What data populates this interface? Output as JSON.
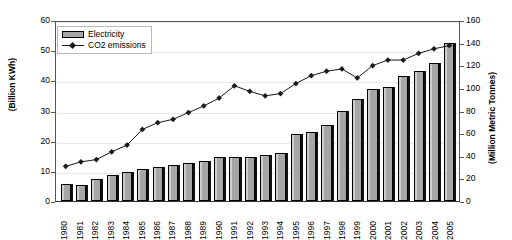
{
  "chart_data": {
    "type": "bar",
    "title": "",
    "xlabel": "",
    "ylabel": "(Billion KWh)",
    "y2label": "(Million Metric Tonnes)",
    "grid": true,
    "legend_position": "top-left",
    "ylim": [
      0,
      60
    ],
    "y2lim": [
      0,
      160
    ],
    "yticks": [
      0,
      10,
      20,
      30,
      40,
      50,
      60
    ],
    "y2ticks": [
      0,
      20,
      40,
      60,
      80,
      100,
      120,
      140,
      160
    ],
    "categories": [
      "1980",
      "1981",
      "1982",
      "1983",
      "1984",
      "1985",
      "1986",
      "1987",
      "1988",
      "1989",
      "1990",
      "1991",
      "1992",
      "1993",
      "1994",
      "1995",
      "1996",
      "1997",
      "1998",
      "1999",
      "2000",
      "2001",
      "2002",
      "2003",
      "2004",
      "2005"
    ],
    "series": [
      {
        "name": "Electricity",
        "axis": "left",
        "render": "bar",
        "color": "#a6a6a6",
        "units": "Billion KWh",
        "values": [
          5.6,
          5.3,
          7.4,
          8.6,
          9.5,
          10.5,
          11.2,
          11.8,
          12.7,
          13.1,
          14.5,
          14.5,
          14.6,
          15.3,
          16.0,
          22.2,
          23.0,
          25.1,
          30.0,
          33.8,
          37.0,
          37.7,
          41.5,
          43.2,
          45.8,
          52.5
        ]
      },
      {
        "name": "CO2 emissions",
        "axis": "right",
        "render": "line",
        "color": "#1a1a1a",
        "marker": "diamond",
        "units": "Million Metric Tonnes",
        "values": [
          31,
          35,
          37,
          44,
          50,
          64,
          70,
          73,
          79,
          85,
          92,
          103,
          98,
          94,
          96,
          105,
          112,
          116,
          118,
          110,
          121,
          126,
          126,
          132,
          136,
          139
        ]
      }
    ]
  },
  "legend": {
    "items": [
      {
        "label": "Electricity",
        "marker": "bar-swatch"
      },
      {
        "label": "CO2 emissions",
        "marker": "line-diamond-swatch"
      }
    ]
  }
}
